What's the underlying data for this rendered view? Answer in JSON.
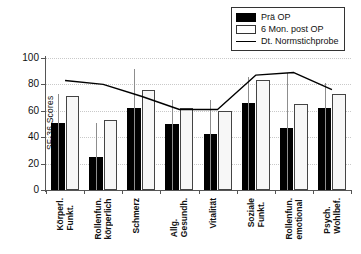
{
  "chart_data": {
    "type": "bar",
    "title": "",
    "xlabel": "",
    "ylabel": "SF-36 Scores",
    "ylim": [
      0,
      100
    ],
    "yticks": [
      0,
      20,
      40,
      60,
      80,
      100
    ],
    "grid": true,
    "legend_position": "top-right",
    "categories": [
      "Körperl.\nFunkt.",
      "Rollenfun.\nkörperlich",
      "Schmerz",
      "Allg.\nGesundh.",
      "Vitalität",
      "Soziale\nFunkt.",
      "Rollenfun.\nemotional",
      "Psych.\nWohlbef."
    ],
    "series": [
      {
        "name": "Prä OP",
        "type": "bar",
        "color": "#000000",
        "values": [
          51,
          25,
          62,
          50,
          42.5,
          66,
          47,
          62.5
        ],
        "errors_upper": [
          73,
          51,
          92,
          68,
          68,
          85.5,
          89,
          81
        ]
      },
      {
        "name": "6 Mon. post OP",
        "type": "bar",
        "color": "#ffffff",
        "values": [
          71.5,
          53,
          76,
          62.5,
          59.5,
          83.5,
          65,
          73
        ],
        "errors_upper": [
          null,
          null,
          null,
          null,
          null,
          null,
          null,
          null
        ]
      },
      {
        "name": "Dt. Normstichprobe",
        "type": "line",
        "color": "#000000",
        "values": [
          83,
          80,
          71,
          61,
          61,
          87,
          89,
          76
        ]
      }
    ]
  },
  "legend": {
    "items": [
      {
        "label": "Prä OP",
        "key": "pre"
      },
      {
        "label": "6 Mon. post OP",
        "key": "post"
      },
      {
        "label": "Dt. Normstichprobe",
        "key": "line"
      }
    ]
  },
  "axis": {
    "y_label": "SF-36 Scores",
    "y_tick_labels": [
      "100",
      "80",
      "60",
      "40",
      "20",
      "0"
    ]
  }
}
